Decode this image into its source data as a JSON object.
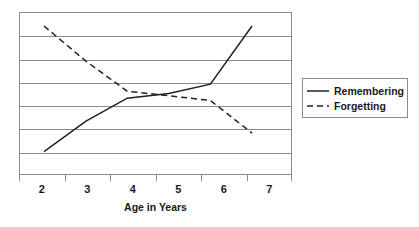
{
  "chart_data": {
    "type": "line",
    "title": "",
    "xlabel": "Age in Years",
    "ylabel": "",
    "x": [
      2,
      3,
      4,
      5,
      6,
      7
    ],
    "categories": [
      "2",
      "3",
      "4",
      "5",
      "6",
      "7"
    ],
    "xlim": [
      2,
      7
    ],
    "ylim": [
      0,
      7
    ],
    "grid": true,
    "gridlines_y": [
      1,
      2,
      3,
      4,
      5,
      6
    ],
    "y_tick_labels": [],
    "legend_position": "right",
    "series": [
      {
        "name": "Remembering",
        "style": "solid",
        "color": "#231f20",
        "values": [
          1.0,
          2.3,
          3.3,
          3.5,
          3.9,
          6.4
        ]
      },
      {
        "name": "Forgetting",
        "style": "dashed",
        "color": "#231f20",
        "values": [
          6.4,
          4.9,
          3.6,
          3.4,
          3.2,
          1.8
        ]
      }
    ],
    "annotations": []
  },
  "axis": {
    "x_title": "Age in Years",
    "tick_labels": [
      "2",
      "3",
      "4",
      "5",
      "6",
      "7"
    ]
  },
  "legend": {
    "items": [
      {
        "label": "Remembering",
        "swatch": "solid-line-icon"
      },
      {
        "label": "Forgetting",
        "swatch": "dashed-line-icon"
      }
    ]
  }
}
